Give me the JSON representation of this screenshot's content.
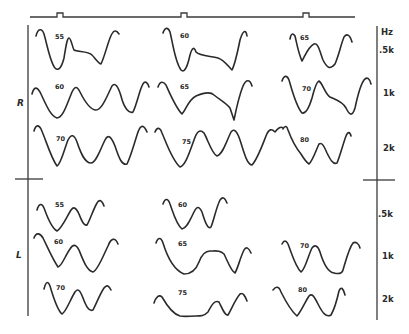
{
  "figure": {
    "side_labels": {
      "right_ear": "R",
      "left_ear": "L"
    },
    "unit_label": "Hz",
    "frequency_labels": {
      "upper": [
        ".5k",
        "1k",
        "2k"
      ],
      "lower": [
        ".5k",
        "1k",
        "2k"
      ]
    },
    "panels": {
      "R": {
        "rows": [
          {
            "frequency": ".5k",
            "levels": [
              "55",
              "60",
              "65"
            ]
          },
          {
            "frequency": "1k",
            "levels": [
              "60",
              "65",
              "70"
            ]
          },
          {
            "frequency": "2k",
            "levels": [
              "70",
              "75",
              "80"
            ]
          }
        ]
      },
      "L": {
        "rows": [
          {
            "frequency": ".5k",
            "levels": [
              "55",
              "60"
            ]
          },
          {
            "frequency": "1k",
            "levels": [
              "60",
              "65",
              "70"
            ]
          },
          {
            "frequency": "2k",
            "levels": [
              "70",
              "75",
              "80"
            ]
          }
        ]
      }
    },
    "stimulus_markers": 3,
    "colors": {
      "ink": "#2b2b2b",
      "paper": "#ffffff"
    }
  }
}
